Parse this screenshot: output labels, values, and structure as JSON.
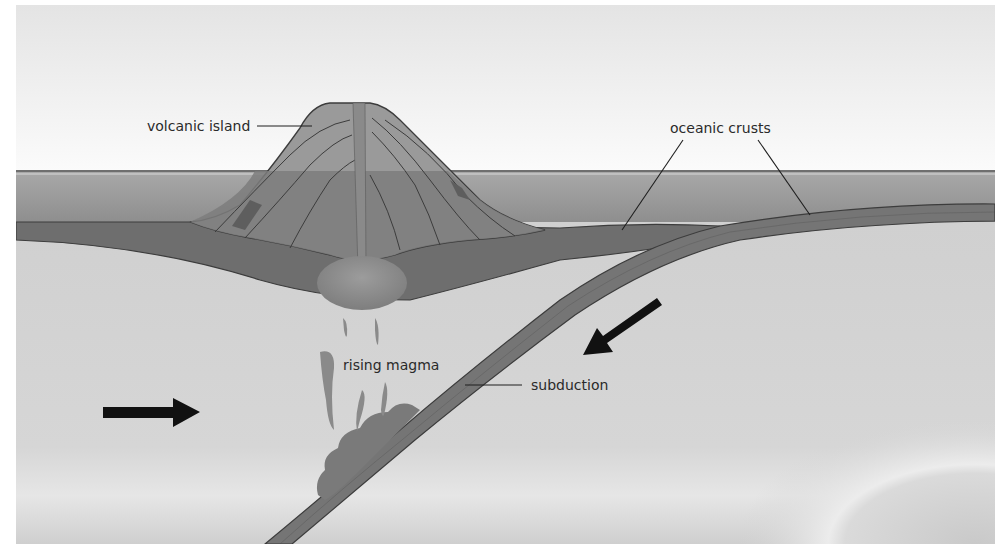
{
  "diagram": {
    "type": "subduction-zone-cross-section",
    "labels": {
      "volcanic_island": "volcanic island",
      "oceanic_crusts": "oceanic crusts",
      "rising_magma": "rising magma",
      "subduction": "subduction"
    },
    "arrows": [
      {
        "name": "plate-motion-right",
        "direction": "right"
      },
      {
        "name": "plate-motion-down-left",
        "direction": "down-left"
      }
    ],
    "colors": {
      "background": "#ffffff",
      "sky_top": "#e6e6e6",
      "sky_bottom": "#fafafa",
      "sea_line": "#7a7a7a",
      "water_top": "#a6a6a6",
      "water_bottom": "#8c8c8c",
      "crust": "#6e6e6e",
      "crust_outline": "#3c3c3c",
      "mantle": "#d2d2d2",
      "volcano_light": "#a0a0a0",
      "volcano_mid": "#8a8a8a",
      "volcano_dark": "#6a6a6a",
      "magma": "#8f8f8f",
      "arrow": "#111111",
      "label_text": "#2a2a2a"
    }
  }
}
